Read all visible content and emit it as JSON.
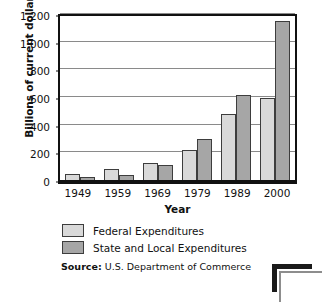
{
  "chart_data": {
    "type": "bar",
    "title": "",
    "xlabel": "Year",
    "ylabel": "Billions of current dollars",
    "categories": [
      "1949",
      "1959",
      "1969",
      "1979",
      "1989",
      "2000"
    ],
    "series": [
      {
        "name": "Federal Expenditures",
        "color": "#d9d9d9",
        "values": [
          40,
          80,
          125,
          215,
          480,
          590
        ]
      },
      {
        "name": "State and Local Expenditures",
        "color": "#a6a6a6",
        "values": [
          20,
          35,
          110,
          295,
          615,
          1150
        ]
      }
    ],
    "ylim": [
      0,
      1200
    ],
    "yticks": [
      0,
      200,
      400,
      600,
      800,
      1000,
      1200
    ],
    "ytick_labels": [
      "0",
      "200",
      "400",
      "600",
      "800",
      "1,000",
      "1,200"
    ],
    "grid": true,
    "legend_position": "bottom-left"
  },
  "legend": {
    "items": [
      {
        "label": "Federal Expenditures",
        "swatch": "federal"
      },
      {
        "label": "State and Local Expenditures",
        "swatch": "state"
      }
    ]
  },
  "source": {
    "prefix": "Source:",
    "text": "U.S. Department of Commerce"
  }
}
